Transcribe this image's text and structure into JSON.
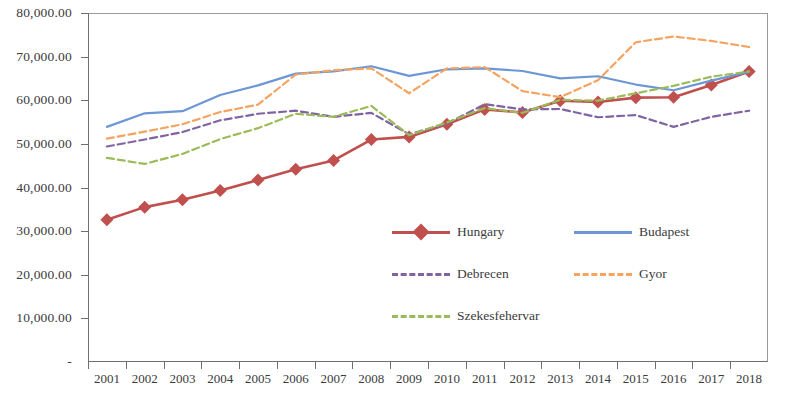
{
  "chart_data": {
    "type": "line",
    "title": "",
    "xlabel": "",
    "ylabel": "",
    "ylim": [
      0,
      80000
    ],
    "ytick_values": [
      0,
      10000,
      20000,
      30000,
      40000,
      50000,
      60000,
      70000,
      80000
    ],
    "ytick_labels": [
      "-",
      "10,000.00",
      "20,000.00",
      "30,000.00",
      "40,000.00",
      "50,000.00",
      "60,000.00",
      "70,000.00",
      "80,000.00"
    ],
    "grid": false,
    "legend_position": "inside-lower-center",
    "categories": [
      "2001",
      "2002",
      "2003",
      "2004",
      "2005",
      "2006",
      "2007",
      "2008",
      "2009",
      "2010",
      "2011",
      "2012",
      "2013",
      "2014",
      "2015",
      "2016",
      "2017",
      "2018"
    ],
    "series": [
      {
        "name": "Hungary",
        "color": "#C0504D",
        "style": "solid",
        "marker": "diamond",
        "values": [
          32600,
          35500,
          37200,
          39300,
          41700,
          44200,
          46200,
          51000,
          51600,
          54500,
          57900,
          57200,
          59900,
          59600,
          60600,
          60700,
          63500,
          66600
        ]
      },
      {
        "name": "Budapest",
        "color": "#6D97D4",
        "style": "solid",
        "marker": "none",
        "values": [
          53900,
          57000,
          57500,
          61200,
          63400,
          66100,
          66600,
          67800,
          65600,
          67100,
          67300,
          66700,
          65000,
          65500,
          63600,
          62300,
          64500,
          66500
        ]
      },
      {
        "name": "Debrecen",
        "color": "#8064A2",
        "style": "dashed",
        "marker": "none",
        "values": [
          49400,
          51000,
          52700,
          55400,
          56900,
          57600,
          56200,
          57100,
          52200,
          54600,
          59100,
          57900,
          58000,
          56100,
          56600,
          53900,
          56200,
          57600
        ]
      },
      {
        "name": "Gyor",
        "color": "#F4A460",
        "style": "dashed",
        "marker": "none",
        "values": [
          51200,
          52800,
          54500,
          57300,
          59000,
          65900,
          66900,
          67300,
          61600,
          67300,
          67600,
          62100,
          60700,
          64600,
          73300,
          74600,
          73600,
          72200
        ]
      },
      {
        "name": "Szekesfehervar",
        "color": "#9BBB59",
        "style": "dashed",
        "marker": "none",
        "values": [
          46800,
          45400,
          47700,
          51100,
          53600,
          56900,
          56200,
          58700,
          52000,
          54900,
          58200,
          57100,
          60100,
          59900,
          61600,
          63300,
          65400,
          66600
        ]
      }
    ]
  },
  "legend": {
    "items": [
      {
        "label": "Hungary"
      },
      {
        "label": "Budapest"
      },
      {
        "label": "Debrecen"
      },
      {
        "label": "Gyor"
      },
      {
        "label": "Szekesfehervar"
      }
    ]
  }
}
